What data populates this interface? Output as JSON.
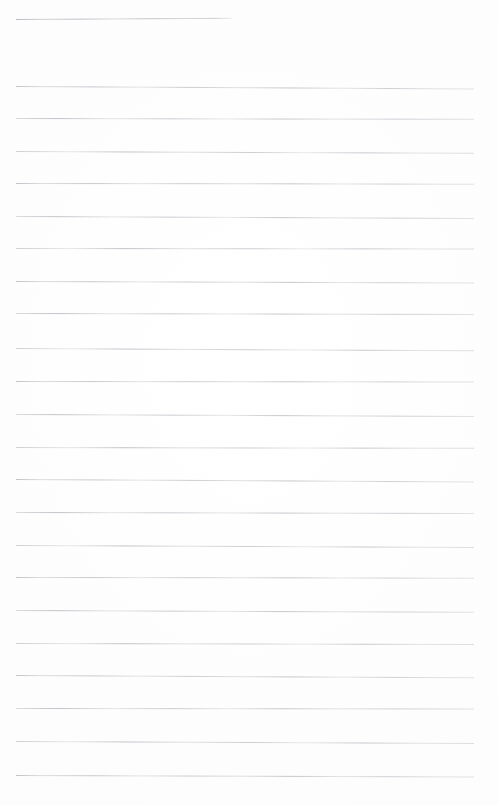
{
  "document": {
    "kind": "scanned-ruled-paper",
    "title": "Blank lined notebook page",
    "page_width": 498,
    "page_height": 805,
    "background_color": "#ffffff",
    "rule_color": "#c3c6cb",
    "rule_thickness_px": 1,
    "content_text": "",
    "text_blocks": [],
    "margin_left_px": 16,
    "margin_right_px": 474,
    "rule_spacing_px": 32.4,
    "rule_count": 25
  },
  "rules": [
    {
      "id": "rule-01",
      "y": 19,
      "x1": 16,
      "x2": 232,
      "kind": "short",
      "skew_deg": -0.3,
      "variant": "short"
    },
    {
      "id": "rule-02",
      "y": 86,
      "x1": 16,
      "x2": 474,
      "kind": "full-width",
      "skew_deg": 0.32,
      "variant": "v1"
    },
    {
      "id": "rule-03",
      "y": 118,
      "x1": 16,
      "x2": 474,
      "kind": "full-width",
      "skew_deg": 0.1,
      "variant": "v2"
    },
    {
      "id": "rule-04",
      "y": 151,
      "x1": 16,
      "x2": 474,
      "kind": "full-width",
      "skew_deg": 0.22,
      "variant": "v3"
    },
    {
      "id": "rule-05",
      "y": 183,
      "x1": 16,
      "x2": 474,
      "kind": "full-width",
      "skew_deg": 0.08,
      "variant": "v1"
    },
    {
      "id": "rule-06",
      "y": 216,
      "x1": 16,
      "x2": 474,
      "kind": "full-width",
      "skew_deg": 0.26,
      "variant": "v2"
    },
    {
      "id": "rule-07",
      "y": 248,
      "x1": 16,
      "x2": 474,
      "kind": "full-width",
      "skew_deg": 0.05,
      "variant": "v3"
    },
    {
      "id": "rule-08",
      "y": 281,
      "x1": 16,
      "x2": 474,
      "kind": "full-width",
      "skew_deg": 0.2,
      "variant": "v1"
    },
    {
      "id": "rule-09",
      "y": 313,
      "x1": 16,
      "x2": 474,
      "kind": "full-width",
      "skew_deg": 0.12,
      "variant": "v2"
    },
    {
      "id": "rule-10",
      "y": 348,
      "x1": 16,
      "x2": 474,
      "kind": "full-width",
      "skew_deg": 0.28,
      "variant": "v3"
    },
    {
      "id": "rule-11",
      "y": 381,
      "x1": 16,
      "x2": 474,
      "kind": "full-width",
      "skew_deg": 0.06,
      "variant": "v1"
    },
    {
      "id": "rule-12",
      "y": 414,
      "x1": 16,
      "x2": 474,
      "kind": "full-width",
      "skew_deg": 0.24,
      "variant": "v2"
    },
    {
      "id": "rule-13",
      "y": 447,
      "x1": 16,
      "x2": 474,
      "kind": "full-width",
      "skew_deg": 0.1,
      "variant": "v3"
    },
    {
      "id": "rule-14",
      "y": 479,
      "x1": 16,
      "x2": 474,
      "kind": "full-width",
      "skew_deg": 0.3,
      "variant": "v1"
    },
    {
      "id": "rule-15",
      "y": 512,
      "x1": 16,
      "x2": 474,
      "kind": "full-width",
      "skew_deg": 0.14,
      "variant": "v2"
    },
    {
      "id": "rule-16",
      "y": 545,
      "x1": 16,
      "x2": 474,
      "kind": "full-width",
      "skew_deg": 0.26,
      "variant": "v3"
    },
    {
      "id": "rule-17",
      "y": 577,
      "x1": 16,
      "x2": 474,
      "kind": "full-width",
      "skew_deg": 0.08,
      "variant": "v1"
    },
    {
      "id": "rule-18",
      "y": 610,
      "x1": 16,
      "x2": 474,
      "kind": "full-width",
      "skew_deg": 0.22,
      "variant": "v2"
    },
    {
      "id": "rule-19",
      "y": 643,
      "x1": 16,
      "x2": 474,
      "kind": "full-width",
      "skew_deg": 0.12,
      "variant": "v3"
    },
    {
      "id": "rule-20",
      "y": 675,
      "x1": 16,
      "x2": 474,
      "kind": "full-width",
      "skew_deg": 0.28,
      "variant": "v1"
    },
    {
      "id": "rule-21",
      "y": 708,
      "x1": 16,
      "x2": 474,
      "kind": "full-width",
      "skew_deg": 0.06,
      "variant": "v2"
    },
    {
      "id": "rule-22",
      "y": 741,
      "x1": 16,
      "x2": 474,
      "kind": "full-width",
      "skew_deg": 0.24,
      "variant": "v3"
    },
    {
      "id": "rule-23",
      "y": 775,
      "x1": 16,
      "x2": 474,
      "kind": "full-width",
      "skew_deg": 0.18,
      "variant": "v1"
    }
  ]
}
